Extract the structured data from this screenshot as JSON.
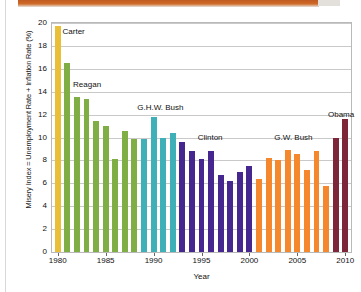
{
  "chart_data": {
    "type": "bar",
    "title": "",
    "xlabel": "Year",
    "ylabel": "Misery Index = Unemployment Rate + Inflation Rate (%)",
    "ylim": [
      0,
      20
    ],
    "ytick_values": [
      0,
      2,
      4,
      6,
      8,
      10,
      12,
      14,
      16,
      18,
      20
    ],
    "xlim": [
      1979.4,
      2010.6
    ],
    "xtick_values": [
      1980,
      1985,
      1990,
      1995,
      2000,
      2005,
      2010
    ],
    "grid": "horizontal",
    "legend": "none",
    "categories": [
      1980,
      1981,
      1982,
      1983,
      1984,
      1985,
      1986,
      1987,
      1988,
      1989,
      1990,
      1991,
      1992,
      1993,
      1994,
      1995,
      1996,
      1997,
      1998,
      1999,
      2000,
      2001,
      2002,
      2003,
      2004,
      2005,
      2006,
      2007,
      2008,
      2009,
      2010
    ],
    "values": [
      19.7,
      16.5,
      13.5,
      13.4,
      11.4,
      11.0,
      8.1,
      10.6,
      9.9,
      9.9,
      11.75,
      10.0,
      10.4,
      9.65,
      8.85,
      8.15,
      8.8,
      6.7,
      6.2,
      7.0,
      7.5,
      6.4,
      8.25,
      8.0,
      8.9,
      8.55,
      7.2,
      8.8,
      5.8,
      10.0,
      11.6
    ],
    "groups": [
      {
        "name": "Carter",
        "color": "#e8bf37",
        "start_year": 1980,
        "end_year": 1980
      },
      {
        "name": "Reagan",
        "color": "#7fae45",
        "start_year": 1981,
        "end_year": 1988
      },
      {
        "name": "G.H.W. Bush",
        "color": "#3fb0b8",
        "start_year": 1989,
        "end_year": 1992
      },
      {
        "name": "Clinton",
        "color": "#46268f",
        "start_year": 1993,
        "end_year": 2000
      },
      {
        "name": "G.W. Bush",
        "color": "#f5872c",
        "start_year": 2001,
        "end_year": 2008
      },
      {
        "name": "Obama",
        "color": "#7e2639",
        "start_year": 2009,
        "end_year": 2010
      }
    ],
    "annotations": [
      {
        "text": "Carter",
        "year": 1980.5,
        "value": 19.2
      },
      {
        "text": "Reagan",
        "year": 1981.6,
        "value": 14.6
      },
      {
        "text": "G.H.W. Bush",
        "year": 1988.3,
        "value": 12.6
      },
      {
        "text": "Clinton",
        "year": 1994.6,
        "value": 10.0
      },
      {
        "text": "G.W. Bush",
        "year": 2002.6,
        "value": 10.0
      },
      {
        "text": "Obama",
        "year": 2008.2,
        "value": 12.0
      }
    ]
  }
}
